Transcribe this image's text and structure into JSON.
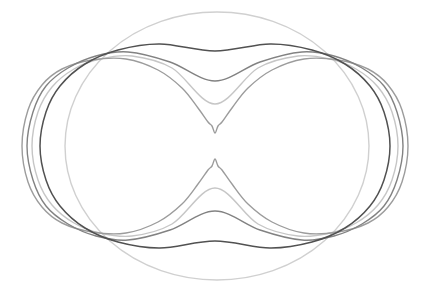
{
  "canvas": {
    "width": 428,
    "height": 291,
    "background": "#ffffff"
  },
  "figure": {
    "center_x": 215,
    "center_y": 146,
    "mirror_sum": 292,
    "curves": [
      {
        "name": "outer-light-oval",
        "kind": "ellipse",
        "color": "#d0d0d0",
        "stroke_width": 1.4,
        "cx": 217,
        "cy": 146,
        "rx": 152,
        "ry": 134
      },
      {
        "name": "light-pinched-oval",
        "kind": "peanut",
        "color": "#c6c6c6",
        "stroke_width": 1.4,
        "top_points": [
          [
            32,
            146
          ],
          [
            38,
            112
          ],
          [
            52,
            87
          ],
          [
            74,
            69
          ],
          [
            100,
            59
          ],
          [
            132,
            56
          ],
          [
            172,
            68
          ],
          [
            215,
            104
          ],
          [
            258,
            68
          ],
          [
            298,
            56
          ],
          [
            330,
            59
          ],
          [
            356,
            69
          ],
          [
            378,
            87
          ],
          [
            392,
            112
          ],
          [
            398,
            146
          ]
        ]
      },
      {
        "name": "near-lemniscate-oval",
        "kind": "peanut",
        "color": "#9c9c9c",
        "stroke_width": 1.4,
        "top_points": [
          [
            22,
            146
          ],
          [
            28,
            110
          ],
          [
            42,
            85
          ],
          [
            62,
            69
          ],
          [
            92,
            60
          ],
          [
            126,
            59
          ],
          [
            158,
            70
          ],
          [
            182,
            88
          ],
          [
            198,
            108
          ],
          [
            208,
            122
          ],
          [
            212,
            126
          ],
          [
            215,
            133
          ],
          [
            218,
            126
          ],
          [
            222,
            122
          ],
          [
            232,
            108
          ],
          [
            248,
            88
          ],
          [
            272,
            70
          ],
          [
            304,
            59
          ],
          [
            338,
            60
          ],
          [
            368,
            69
          ],
          [
            388,
            85
          ],
          [
            402,
            110
          ],
          [
            408,
            146
          ]
        ]
      },
      {
        "name": "medium-gray-oval",
        "kind": "peanut",
        "color": "#828282",
        "stroke_width": 1.4,
        "top_points": [
          [
            27,
            146
          ],
          [
            33,
            112
          ],
          [
            46,
            86
          ],
          [
            68,
            68
          ],
          [
            96,
            56
          ],
          [
            128,
            52
          ],
          [
            170,
            62
          ],
          [
            215,
            81
          ],
          [
            260,
            62
          ],
          [
            302,
            52
          ],
          [
            334,
            56
          ],
          [
            362,
            68
          ],
          [
            384,
            86
          ],
          [
            397,
            112
          ],
          [
            403,
            146
          ]
        ]
      },
      {
        "name": "dark-waisted-oval",
        "kind": "peanut",
        "color": "#515151",
        "stroke_width": 1.5,
        "top_points": [
          [
            40,
            146
          ],
          [
            46,
            112
          ],
          [
            60,
            86
          ],
          [
            85,
            64
          ],
          [
            118,
            50
          ],
          [
            160,
            44
          ],
          [
            215,
            51
          ],
          [
            270,
            44
          ],
          [
            312,
            50
          ],
          [
            345,
            64
          ],
          [
            370,
            86
          ],
          [
            384,
            112
          ],
          [
            390,
            146
          ]
        ]
      }
    ]
  }
}
